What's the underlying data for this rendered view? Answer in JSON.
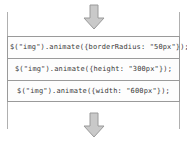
{
  "diagram": {
    "rail_color": "#b0b0b0",
    "arrow_color": "#c4c4c4",
    "arrow_border_color": "#9a9a9a",
    "box_border_color": "#9a9a9a",
    "text_color": "#3a3a3a",
    "arrows": [
      {
        "name": "top-arrow",
        "direction": "down"
      },
      {
        "name": "bottom-arrow",
        "direction": "down"
      }
    ],
    "rails": [
      {
        "name": "left-rail"
      },
      {
        "name": "right-rail"
      }
    ],
    "queue": [
      {
        "code": "$(\"img\").animate({borderRadius: \"50px\"});"
      },
      {
        "code": "$(\"img\").animate({height: \"300px\"});"
      },
      {
        "code": "$(\"img\").animate({width: \"600px\"});"
      }
    ]
  }
}
